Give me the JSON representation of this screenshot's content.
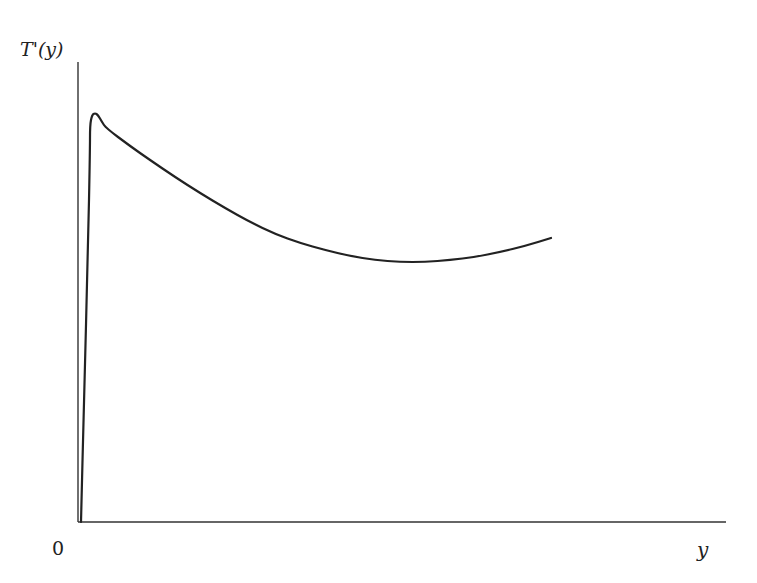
{
  "chart_data": {
    "type": "line",
    "title": "",
    "xlabel": "y",
    "ylabel": "T'(y)",
    "origin_label": "0",
    "grid": false,
    "legend": null,
    "x_ticks": [],
    "y_ticks": [],
    "axes": {
      "x_axis_px": {
        "x0": 78,
        "x1": 726,
        "y": 522
      },
      "y_axis_px": {
        "x": 78,
        "y0": 522,
        "y1": 62
      }
    },
    "series": [
      {
        "name": "T'(y)",
        "color": "#222222",
        "description": "Sharp near-vertical rise from origin to a peak, then a decreasing convex curve to a minimum, then slight rise",
        "points_px": [
          [
            81,
            522
          ],
          [
            84,
            400
          ],
          [
            88,
            250
          ],
          [
            90,
            150
          ],
          [
            90,
            125
          ],
          [
            92,
            115
          ],
          [
            95,
            113
          ],
          [
            98,
            115
          ],
          [
            102,
            122
          ],
          [
            106,
            128
          ],
          [
            130,
            146
          ],
          [
            150,
            160
          ],
          [
            175,
            177
          ],
          [
            200,
            193
          ],
          [
            225,
            208
          ],
          [
            250,
            222
          ],
          [
            275,
            234
          ],
          [
            300,
            243
          ],
          [
            325,
            250
          ],
          [
            350,
            256
          ],
          [
            375,
            260
          ],
          [
            400,
            262
          ],
          [
            425,
            262
          ],
          [
            450,
            260
          ],
          [
            475,
            257
          ],
          [
            500,
            252
          ],
          [
            525,
            246
          ],
          [
            551,
            238
          ]
        ]
      }
    ]
  }
}
